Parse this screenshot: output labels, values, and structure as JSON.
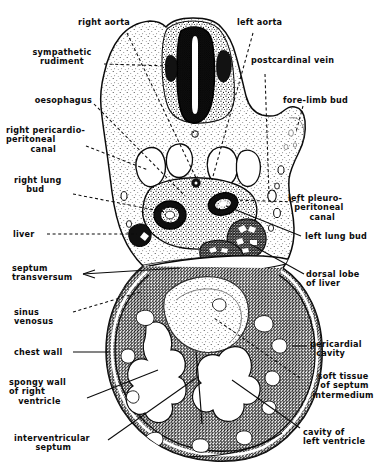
{
  "figure": {
    "kind": "anatomical-section-diagram",
    "style": "stippled line engraving, black ink on white",
    "colors": {
      "ink": "#0b0b0b",
      "paper": "#ffffff",
      "mid_tone": "#7a7a7a",
      "dark_tone": "#2b2b2b"
    }
  },
  "labels": {
    "right_aorta": "right aorta",
    "left_aorta": "left aorta",
    "sympathetic_rudiment": "sympathetic\nrudiment",
    "postcardinal_vein": "postcardinal vein",
    "oesophagus": "oesophagus",
    "fore_limb_bud": "fore-limb bud",
    "right_pericardio_peritoneal_canal": "right pericardio-\nperitoneal\n        canal",
    "right_lung_bud": "right lung\n    bud",
    "left_pleuro_peritoneal_canal": "left pleuro-\n  peritoneal\n       canal",
    "liver": "liver",
    "left_lung_bud": "left lung bud",
    "septum_transversum": "septum\ntransversum",
    "dorsal_lobe_of_liver": "dorsal lobe\nof liver",
    "sinus_venosus": "sinus\nvenosus",
    "pericardial_cavity": "pericardial\n  cavity",
    "chest_wall": "chest wall",
    "spongy_wall_of_right_ventricle": "spongy wall\nof right\n   ventricle",
    "soft_tissue_of_septum_intermedium": "soft tissue\n of septum\nintermedium",
    "interventricular_septum": "interventricular\n       septum",
    "cavity_of_left_ventricle": "cavity of\nleft ventricle"
  },
  "leader_dash_pattern": "3 2.6"
}
